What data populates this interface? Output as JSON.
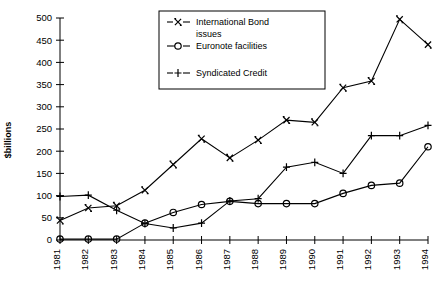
{
  "chart_data": {
    "type": "line",
    "title": "",
    "xlabel": "",
    "ylabel": "$billions",
    "ylim": [
      0,
      500
    ],
    "ytick_step": 50,
    "yticks": [
      0,
      50,
      100,
      150,
      200,
      250,
      300,
      350,
      400,
      450,
      500
    ],
    "grid": false,
    "legend_position": "top-center",
    "categories": [
      "1981",
      "1982",
      "1983",
      "1984",
      "1985",
      "1986",
      "1987",
      "1988",
      "1989",
      "1990",
      "1991",
      "1992",
      "1993",
      "1994"
    ],
    "series": [
      {
        "name": "International Bond issues",
        "marker": "x",
        "linestyle": "dashed",
        "values": [
          44,
          72,
          77,
          112,
          170,
          228,
          185,
          225,
          270,
          265,
          343,
          358,
          497,
          440
        ]
      },
      {
        "name": "Euronote facilities",
        "marker": "o",
        "linestyle": "solid",
        "values": [
          2,
          2,
          2,
          38,
          62,
          80,
          87,
          82,
          82,
          82,
          105,
          123,
          128,
          210
        ]
      },
      {
        "name": "Syndicated Credit",
        "marker": "plus",
        "linestyle": "dashed",
        "values": [
          98,
          101,
          67,
          37,
          27,
          38,
          88,
          93,
          164,
          175,
          150,
          235,
          235,
          258
        ]
      }
    ]
  },
  "legend": {
    "items": [
      {
        "label_line1": "International Bond",
        "label_line2": "issues",
        "marker": "x"
      },
      {
        "label_line1": "Euronote facilities",
        "label_line2": "",
        "marker": "o"
      },
      {
        "label_line1": "Syndicated Credit",
        "label_line2": "",
        "marker": "plus"
      }
    ]
  },
  "axis": {
    "y_title": "$billions"
  },
  "colors": {
    "line": "#000000",
    "background": "#ffffff",
    "axis": "#000000",
    "faint_grid": "#b9b9b9"
  }
}
